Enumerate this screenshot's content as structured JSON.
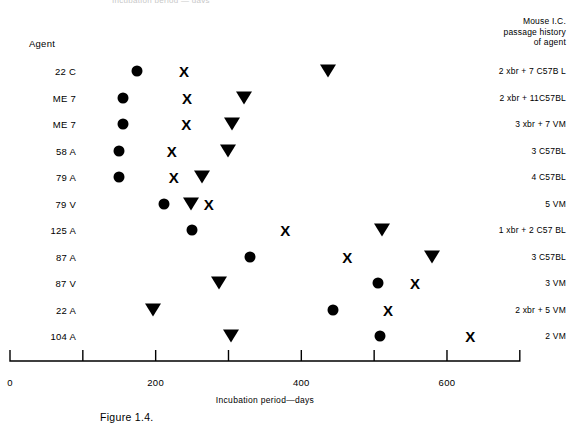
{
  "figure": {
    "top_clipped_text": "Incubation period — days",
    "caption": "Figure 1.4.",
    "axis_title": "Incubation period—days",
    "agent_column_header": "Agent",
    "passage_column_header_lines": [
      "Mouse I.C.",
      "passage history",
      "of agent"
    ]
  },
  "chart_data": {
    "type": "scatter",
    "title": "",
    "xlabel": "Incubation period—days",
    "ylabel": "Agent",
    "xlim": [
      0,
      700
    ],
    "xticks": [
      0,
      100,
      200,
      300,
      400,
      500,
      600,
      700
    ],
    "xticklabels": [
      "0",
      "",
      "200",
      "",
      "400",
      "",
      "600",
      ""
    ],
    "grid": false,
    "legend_position": "none",
    "series": [
      {
        "name": "circle",
        "symbol": "●"
      },
      {
        "name": "cross",
        "symbol": "X"
      },
      {
        "name": "triangle-down",
        "symbol": "▼"
      }
    ],
    "categories": [
      "22 C",
      "ME 7",
      "ME 7",
      "58 A",
      "79 A",
      "79 V",
      "125 A",
      "87 A",
      "87 V",
      "22 A",
      "104 A"
    ],
    "rows": [
      {
        "agent": "22 C",
        "passage": "2 xbr + 7 C57B L",
        "circle": 174,
        "cross": 239,
        "triangle": 437
      },
      {
        "agent": "ME 7",
        "passage": "2 xbr + 11C57BL",
        "circle": 155,
        "cross": 243,
        "triangle": 321
      },
      {
        "agent": "ME 7",
        "passage": "3 xbr + 7 VM",
        "circle": 155,
        "cross": 242,
        "triangle": 305
      },
      {
        "agent": "58 A",
        "passage": "3 C57BL",
        "circle": 150,
        "cross": 222,
        "triangle": 299
      },
      {
        "agent": "79 A",
        "passage": "4 C57BL",
        "circle": 150,
        "cross": 225,
        "triangle": 264
      },
      {
        "agent": "79 V",
        "passage": "5 VM",
        "circle": 212,
        "cross": 273,
        "triangle": 249
      },
      {
        "agent": "125 A",
        "passage": "1 xbr + 2 C57 BL",
        "circle": 250,
        "cross": 378,
        "triangle": 511
      },
      {
        "agent": "87 A",
        "passage": "3 C57BL",
        "circle": 330,
        "cross": 463,
        "triangle": 580
      },
      {
        "agent": "87 V",
        "passage": "3 VM",
        "circle": 505,
        "cross": 556,
        "triangle": 287
      },
      {
        "agent": "22 A",
        "passage": "2 xbr + 5 VM",
        "circle": 443,
        "cross": 519,
        "triangle": 196
      },
      {
        "agent": "104 A",
        "passage": "2 VM",
        "circle": 508,
        "cross": 632,
        "triangle": 303
      }
    ]
  },
  "axis": {
    "origin_px": 10,
    "px_per_day": 0.7283,
    "baseline_y": 361,
    "tick_height": 11,
    "end_day": 700
  },
  "layout": {
    "first_row_top": 58,
    "row_step": 26.5
  }
}
